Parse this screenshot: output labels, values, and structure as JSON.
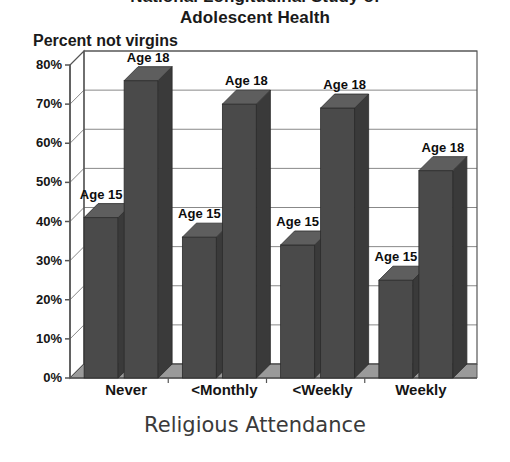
{
  "chart": {
    "title_line1": "National Longitudinal Study of",
    "title_line2": "Adolescent Health",
    "y_axis_title": "Percent not virgins",
    "x_axis_title": "Religious Attendance",
    "bar_color": "#4a4a4a",
    "bar_side_color": "#3a3a3a",
    "bar_top_color": "#5e5e5e",
    "floor_color": "#9a9a9a",
    "axis_color": "#555555",
    "grid_color": "#888888"
  },
  "chart_data": {
    "type": "bar",
    "title": "National Longitudinal Study of Adolescent Health",
    "xlabel": "Religious Attendance",
    "ylabel": "Percent not virgins",
    "categories": [
      "Never",
      "<Monthly",
      "<Weekly",
      "Weekly"
    ],
    "ylim": [
      0,
      80
    ],
    "ytick_labels": [
      "0%",
      "10%",
      "20%",
      "30%",
      "40%",
      "50%",
      "60%",
      "70%",
      "80%"
    ],
    "ytick_values": [
      0,
      10,
      20,
      30,
      40,
      50,
      60,
      70,
      80
    ],
    "grid": true,
    "legend": "none",
    "annotations_style": "per-bar text labels above each bar",
    "series": [
      {
        "name": "Age 15",
        "label": "Age 15",
        "values": [
          41,
          36,
          34,
          25
        ]
      },
      {
        "name": "Age 18",
        "label": "Age 18",
        "values": [
          76,
          70,
          69,
          53
        ]
      }
    ]
  },
  "ticks": [
    {
      "label": "80%",
      "value": 80
    },
    {
      "label": "70%",
      "value": 70
    },
    {
      "label": "60%",
      "value": 60
    },
    {
      "label": "50%",
      "value": 50
    },
    {
      "label": "40%",
      "value": 40
    },
    {
      "label": "30%",
      "value": 30
    },
    {
      "label": "20%",
      "value": 20
    },
    {
      "label": "10%",
      "value": 10
    },
    {
      "label": "0%",
      "value": 0
    }
  ],
  "groups": [
    {
      "category": "Never",
      "bars": [
        {
          "label": "Age 15",
          "value": 41
        },
        {
          "label": "Age 18",
          "value": 76
        }
      ]
    },
    {
      "category": "<Monthly",
      "bars": [
        {
          "label": "Age 15",
          "value": 36
        },
        {
          "label": "Age 18",
          "value": 70
        }
      ]
    },
    {
      "category": "<Weekly",
      "bars": [
        {
          "label": "Age 15",
          "value": 34
        },
        {
          "label": "Age 18",
          "value": 69
        }
      ]
    },
    {
      "category": "Weekly",
      "bars": [
        {
          "label": "Age 15",
          "value": 25
        },
        {
          "label": "Age 18",
          "value": 53
        }
      ]
    }
  ]
}
